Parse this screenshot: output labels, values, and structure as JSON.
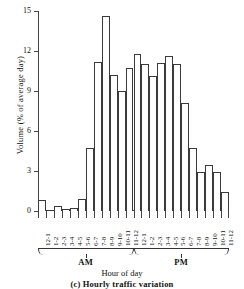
{
  "caption": "(c)  Hourly  traffic  variation",
  "axis": {
    "ylabel": "Volume (% of average day)",
    "xlabel": "Hour of day",
    "yticks": [
      "0",
      "3",
      "6",
      "9",
      "12",
      "15"
    ]
  },
  "periods": [
    {
      "label": "AM"
    },
    {
      "label": "PM"
    }
  ],
  "chart_data": {
    "type": "bar",
    "title": "(c)  Hourly  traffic  variation",
    "xlabel": "Hour of day",
    "ylabel": "Volume (% of average day)",
    "ylim": [
      0,
      15
    ],
    "ytick_values": [
      0,
      3,
      6,
      9,
      12,
      15
    ],
    "grid": false,
    "legend": null,
    "categories": [
      "12-1",
      "1-2",
      "2-3",
      "3-4",
      "4-5",
      "5-6",
      "6-7",
      "7-8",
      "8-9",
      "9-10",
      "10-11",
      "11-12",
      "12-1",
      "1-2",
      "2-3",
      "3-4",
      "4-5",
      "5-6",
      "6-7",
      "7-8",
      "8-9",
      "9-10",
      "10-11",
      "11-12"
    ],
    "period_labels": [
      "AM",
      "AM",
      "AM",
      "AM",
      "AM",
      "AM",
      "AM",
      "AM",
      "AM",
      "AM",
      "AM",
      "AM",
      "PM",
      "PM",
      "PM",
      "PM",
      "PM",
      "PM",
      "PM",
      "PM",
      "PM",
      "PM",
      "PM",
      "PM"
    ],
    "values": [
      0.8,
      0.1,
      0.35,
      0.15,
      0.2,
      0.9,
      4.75,
      11.2,
      14.6,
      10.2,
      9.0,
      10.7,
      11.8,
      11.0,
      10.1,
      11.1,
      11.6,
      11.0,
      8.1,
      4.75,
      2.9,
      3.45,
      2.95,
      1.45
    ]
  }
}
